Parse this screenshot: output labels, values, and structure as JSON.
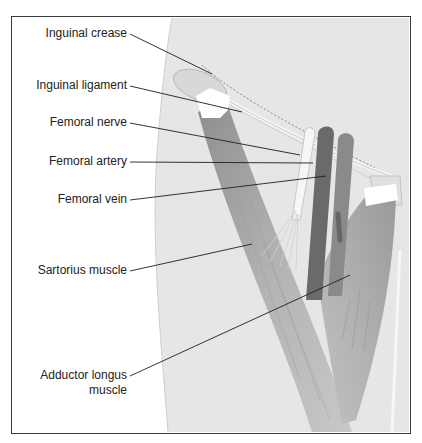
{
  "figure": {
    "labels": [
      {
        "id": "inguinal-crease",
        "text": "Inguinal crease"
      },
      {
        "id": "inguinal-ligament",
        "text": "Inguinal ligament"
      },
      {
        "id": "femoral-nerve",
        "text": "Femoral nerve"
      },
      {
        "id": "femoral-artery",
        "text": "Femoral artery"
      },
      {
        "id": "femoral-vein",
        "text": "Femoral vein"
      },
      {
        "id": "sartorius-muscle",
        "text": "Sartorius muscle"
      },
      {
        "id": "adductor-longus-line1",
        "text": "Adductor longus"
      },
      {
        "id": "adductor-longus-line2",
        "text": "muscle"
      }
    ],
    "colors": {
      "skin": "#e6e6e6",
      "muscle": "#a9a9a9",
      "artery": "#6e6e6e",
      "vein": "#888888",
      "nerve": "#f4f4f4",
      "leader": "#1e1e1e"
    }
  }
}
